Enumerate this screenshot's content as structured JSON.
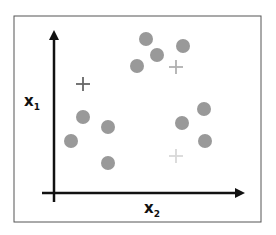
{
  "diagram": {
    "type": "scatter-clustering",
    "axes": {
      "x_label": "x",
      "x_sub": "2",
      "y_label": "x",
      "y_sub": "1"
    },
    "points": [
      {
        "x": 146,
        "y": 39
      },
      {
        "x": 157,
        "y": 55
      },
      {
        "x": 183,
        "y": 46
      },
      {
        "x": 137,
        "y": 66
      },
      {
        "x": 83,
        "y": 117
      },
      {
        "x": 108,
        "y": 127
      },
      {
        "x": 71,
        "y": 141
      },
      {
        "x": 108,
        "y": 163
      },
      {
        "x": 182,
        "y": 123
      },
      {
        "x": 204,
        "y": 109
      },
      {
        "x": 205,
        "y": 141
      }
    ],
    "centroids": [
      {
        "x": 83,
        "y": 84,
        "color": "#666666"
      },
      {
        "x": 176,
        "y": 67,
        "color": "#b0b0b0"
      },
      {
        "x": 176,
        "y": 156,
        "color": "#d8d8d8"
      }
    ],
    "colors": {
      "point": "#999999",
      "axis": "#111111",
      "frame": "#555555"
    }
  }
}
